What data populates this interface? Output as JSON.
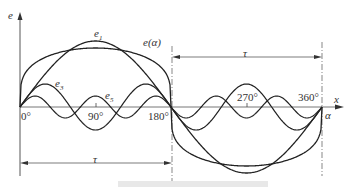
{
  "diagram": {
    "type": "waveform-harmonic-decomposition",
    "axes": {
      "y_label": "e",
      "x_label": "x",
      "x_label_secondary": "α",
      "ticks": [
        "0°",
        "90°",
        "180°",
        "270°",
        "360°"
      ]
    },
    "curves": [
      {
        "name": "e1",
        "label": "e",
        "subscript": "1",
        "kind": "fundamental",
        "harmonic": 1,
        "amplitude": 66
      },
      {
        "name": "e(α)",
        "label": "e(α)",
        "kind": "flat-top resultant",
        "amplitude": 59
      },
      {
        "name": "e3",
        "label": "e",
        "subscript": "3",
        "kind": "3rd harmonic",
        "harmonic": 3,
        "amplitude": 23
      },
      {
        "name": "e5",
        "label": "e",
        "subscript": "5",
        "kind": "5th harmonic",
        "harmonic": 5,
        "amplitude": 11
      }
    ],
    "dimensions": [
      {
        "name": "tau-top",
        "label": "τ",
        "from": "180°",
        "to": "360°"
      },
      {
        "name": "tau-bottom",
        "label": "τ",
        "from": "0°",
        "to": "180°"
      }
    ],
    "colors": {
      "line": "#222222",
      "axis": "#444444",
      "text": "#333333"
    },
    "caption": ""
  }
}
